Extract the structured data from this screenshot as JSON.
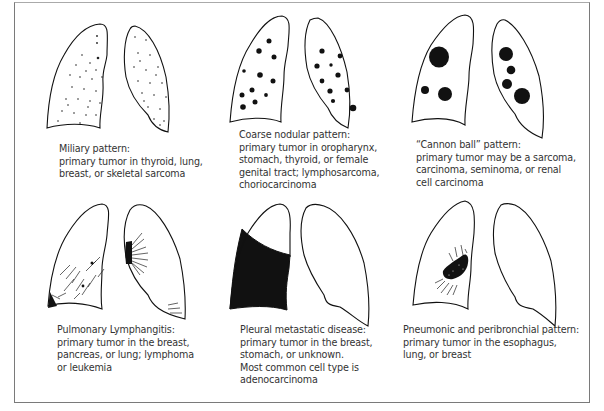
{
  "figure": {
    "panels": [
      {
        "id": "miliary",
        "title": "Miliary pattern:",
        "lines": [
          "primary tumor in thyroid, lung,",
          "breast, or skeletal sarcoma"
        ]
      },
      {
        "id": "coarse-nodular",
        "title": "Coarse nodular pattern:",
        "lines": [
          "primary tumor in oropharynx,",
          "stomach, thyroid, or female",
          "genital tract; lymphosarcoma,",
          "choriocarcinoma"
        ]
      },
      {
        "id": "cannon-ball",
        "title": "“Cannon ball” pattern:",
        "lines": [
          "primary tumor may be a sarcoma,",
          "carcinoma, seminoma, or renal",
          "cell carcinoma"
        ]
      },
      {
        "id": "lymphangitis",
        "title": "Pulmonary Lymphangitis:",
        "lines": [
          "primary tumor in the breast,",
          "pancreas, or lung; lymphoma",
          "or leukemia"
        ]
      },
      {
        "id": "pleural",
        "title": "Pleural metastatic disease:",
        "lines": [
          "primary tumor in the breast,",
          "stomach, or unknown.",
          "Most common cell type is",
          "adenocarcinoma"
        ]
      },
      {
        "id": "pneumonic",
        "title": "Pneumonic and peribronchial pattern:",
        "lines": [
          "primary tumor in the esophagus,",
          "lung, or breast"
        ]
      }
    ]
  },
  "colors": {
    "ink": "#111111",
    "text": "#333333",
    "border": "#7a7a7a"
  }
}
